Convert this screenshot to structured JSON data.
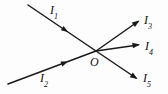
{
  "figure": {
    "background_color": "#fdfdfd",
    "stroke_color": "#1a1a1a",
    "node": {
      "label": "O",
      "x": 96,
      "y": 51
    },
    "labels": [
      {
        "id": "I1",
        "base": "I",
        "sub": "1",
        "x": 50,
        "y": 4
      },
      {
        "id": "I2",
        "base": "I",
        "sub": "2",
        "x": 40,
        "y": 72
      },
      {
        "id": "I3",
        "base": "I",
        "sub": "3",
        "x": 144,
        "y": 14
      },
      {
        "id": "I4",
        "base": "I",
        "sub": "4",
        "x": 145,
        "y": 40
      },
      {
        "id": "I5",
        "base": "I",
        "sub": "5",
        "x": 143,
        "y": 72
      },
      {
        "id": "O",
        "base": "O",
        "sub": "",
        "x": 90,
        "y": 56
      }
    ],
    "rays": [
      {
        "id": "I1",
        "name": "ray-I1-incoming",
        "x1": 28,
        "y1": 5,
        "x2": 96,
        "y2": 51,
        "direction": "toward-node",
        "arrow_at": {
          "x": 64,
          "y": 29,
          "angle": 34
        }
      },
      {
        "id": "I2",
        "name": "ray-I2-incoming",
        "x1": 8,
        "y1": 84,
        "x2": 96,
        "y2": 51,
        "direction": "toward-node",
        "arrow_at": {
          "x": 66,
          "y": 62,
          "angle": -21
        }
      },
      {
        "id": "I3",
        "name": "ray-I3-outgoing",
        "x1": 96,
        "y1": 51,
        "x2": 139,
        "y2": 21,
        "direction": "away-from-node",
        "arrow_at": {
          "x": 139,
          "y": 21,
          "angle": -35
        }
      },
      {
        "id": "I4",
        "name": "ray-I4-outgoing",
        "x1": 96,
        "y1": 51,
        "x2": 139,
        "y2": 45,
        "direction": "away-from-node",
        "arrow_at": {
          "x": 139,
          "y": 45,
          "angle": -8
        }
      },
      {
        "id": "I5",
        "name": "ray-I5-outgoing",
        "x1": 96,
        "y1": 51,
        "x2": 137,
        "y2": 79,
        "direction": "away-from-node",
        "arrow_at": {
          "x": 137,
          "y": 79,
          "angle": 34
        }
      }
    ]
  }
}
